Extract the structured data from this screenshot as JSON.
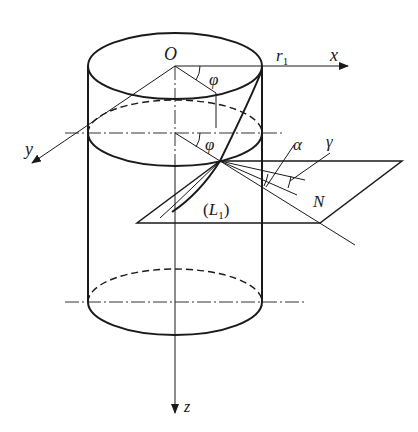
{
  "figure": {
    "labels": {
      "origin": "O",
      "radius": "r",
      "radius_sub": "1",
      "x_axis": "x",
      "y_axis": "y",
      "z_axis": "z",
      "phi_top": "φ",
      "phi_mid": "φ",
      "alpha": "α",
      "gamma": "γ",
      "normal": "N",
      "plane_open": "(",
      "plane_letter": "L",
      "plane_sub": "1",
      "plane_close": ")"
    },
    "colors": {
      "stroke": "#1a1a1a",
      "background": "#ffffff"
    }
  }
}
